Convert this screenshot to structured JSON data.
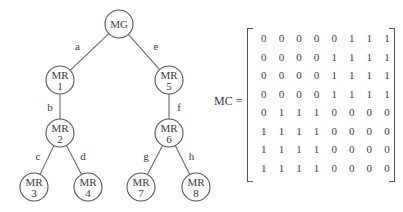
{
  "tree": {
    "nodes": [
      {
        "id": "MG",
        "line1": "MG",
        "line2": "",
        "x": 119,
        "y": 24
      },
      {
        "id": "MR1",
        "line1": "MR",
        "line2": "1",
        "x": 60,
        "y": 80
      },
      {
        "id": "MR5",
        "line1": "MR",
        "line2": "5",
        "x": 169,
        "y": 80
      },
      {
        "id": "MR2",
        "line1": "MR",
        "line2": "2",
        "x": 60,
        "y": 133
      },
      {
        "id": "MR6",
        "line1": "MR",
        "line2": "6",
        "x": 169,
        "y": 133
      },
      {
        "id": "MR3",
        "line1": "MR",
        "line2": "3",
        "x": 34,
        "y": 187
      },
      {
        "id": "MR4",
        "line1": "MR",
        "line2": "4",
        "x": 88,
        "y": 187
      },
      {
        "id": "MR7",
        "line1": "MR",
        "line2": "7",
        "x": 141,
        "y": 187
      },
      {
        "id": "MR8",
        "line1": "MR",
        "line2": "8",
        "x": 196,
        "y": 187
      }
    ],
    "edges": [
      {
        "label": "a",
        "from": "MG",
        "to": "MR1"
      },
      {
        "label": "e",
        "from": "MG",
        "to": "MR5"
      },
      {
        "label": "b",
        "from": "MR1",
        "to": "MR2"
      },
      {
        "label": "f",
        "from": "MR5",
        "to": "MR6"
      },
      {
        "label": "c",
        "from": "MR2",
        "to": "MR3"
      },
      {
        "label": "d",
        "from": "MR2",
        "to": "MR4"
      },
      {
        "label": "g",
        "from": "MR6",
        "to": "MR7"
      },
      {
        "label": "h",
        "from": "MR6",
        "to": "MR8"
      }
    ]
  },
  "matrix": {
    "label": "MC =",
    "rows": [
      [
        0,
        0,
        0,
        0,
        0,
        1,
        1,
        1
      ],
      [
        0,
        0,
        0,
        0,
        1,
        1,
        1,
        1
      ],
      [
        0,
        0,
        0,
        0,
        1,
        1,
        1,
        1
      ],
      [
        0,
        0,
        0,
        0,
        1,
        1,
        1,
        1
      ],
      [
        0,
        1,
        1,
        1,
        0,
        0,
        0,
        0
      ],
      [
        1,
        1,
        1,
        1,
        0,
        0,
        0,
        0
      ],
      [
        1,
        1,
        1,
        1,
        0,
        0,
        0,
        0
      ],
      [
        1,
        1,
        1,
        1,
        0,
        0,
        0,
        0
      ]
    ]
  }
}
